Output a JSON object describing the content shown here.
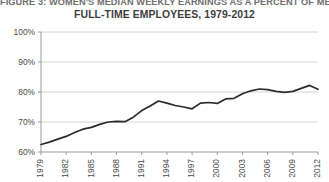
{
  "figure": {
    "title_line1": "FIGURE 3: WOMEN'S MEDIAN WEEKLY EARNINGS AS A PERCENT OF MEN'S,",
    "title_line2": "FULL-TIME EMPLOYEES, 1979-2012"
  },
  "chart_data": {
    "type": "line",
    "title": "FIGURE 3: WOMEN'S MEDIAN WEEKLY EARNINGS AS A PERCENT OF MEN'S, FULL-TIME EMPLOYEES, 1979-2012",
    "xlabel": "",
    "ylabel": "",
    "grid": true,
    "legend": "none",
    "ylim": [
      60,
      100
    ],
    "ytick_labels": [
      "60%",
      "70%",
      "80%",
      "90%",
      "100%"
    ],
    "ytick_values": [
      60,
      70,
      80,
      90,
      100
    ],
    "xlim": [
      1979,
      2012
    ],
    "xtick_labels": [
      "1979",
      "1982",
      "1985",
      "1988",
      "1991",
      "1994",
      "1997",
      "2000",
      "2003",
      "2006",
      "2009",
      "2012"
    ],
    "xtick_values": [
      1979,
      1982,
      1985,
      1988,
      1991,
      1994,
      1997,
      2000,
      2003,
      2006,
      2009,
      2012
    ],
    "x": [
      1979,
      1980,
      1981,
      1982,
      1983,
      1984,
      1985,
      1986,
      1987,
      1988,
      1989,
      1990,
      1991,
      1992,
      1993,
      1994,
      1995,
      1996,
      1997,
      1998,
      1999,
      2000,
      2001,
      2002,
      2003,
      2004,
      2005,
      2006,
      2007,
      2008,
      2009,
      2010,
      2011,
      2012
    ],
    "series": [
      {
        "name": "Women's earnings as percent of men's",
        "color": "#2b2b2b",
        "values": [
          62.5,
          63.3,
          64.3,
          65.2,
          66.5,
          67.6,
          68.2,
          69.2,
          70.0,
          70.2,
          70.1,
          71.6,
          73.8,
          75.3,
          77.0,
          76.3,
          75.5,
          75.0,
          74.4,
          76.3,
          76.5,
          76.2,
          77.7,
          77.9,
          79.4,
          80.4,
          81.0,
          80.8,
          80.2,
          79.9,
          80.2,
          81.2,
          82.2,
          80.9
        ]
      }
    ]
  }
}
